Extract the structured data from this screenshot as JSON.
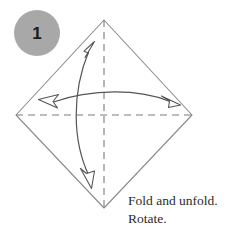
{
  "figure": {
    "kind": "origami-step-diagram",
    "step_badge": {
      "number": "1",
      "shape": "circle",
      "fill_color": "#a8a8a8",
      "text_color": "#1a1a1a",
      "center_x": 37,
      "center_y": 33,
      "radius": 23
    },
    "paper": {
      "name": "square-sheet-rotated-45",
      "outline_color": "#8b8b8b",
      "fill_color": "#ffffff",
      "vertices": [
        {
          "label": "top",
          "x": 104,
          "y": 20
        },
        {
          "label": "right",
          "x": 192,
          "y": 115
        },
        {
          "label": "bottom",
          "x": 104,
          "y": 208
        },
        {
          "label": "left",
          "x": 16,
          "y": 115
        }
      ]
    },
    "crease_lines": [
      {
        "name": "vertical-crease",
        "style": "dashed",
        "color": "#7d7d7d",
        "from": {
          "x": 104,
          "y": 20
        },
        "to": {
          "x": 104,
          "y": 208
        }
      },
      {
        "name": "horizontal-crease",
        "style": "dashed",
        "color": "#7d7d7d",
        "from": {
          "x": 16,
          "y": 115
        },
        "to": {
          "x": 192,
          "y": 115
        }
      }
    ],
    "fold_arrows": [
      {
        "name": "vertical-fold-arrow",
        "orientation": "vertical",
        "double_headed": true,
        "curve_bow": "left",
        "color": "#555555",
        "head_fill": "#ffffff",
        "start": {
          "x": 86,
          "y": 46
        },
        "end": {
          "x": 92,
          "y": 182
        }
      },
      {
        "name": "horizontal-fold-arrow",
        "orientation": "horizontal",
        "double_headed": true,
        "curve_bow": "up",
        "color": "#555555",
        "head_fill": "#ffffff",
        "start": {
          "x": 45,
          "y": 101
        },
        "end": {
          "x": 172,
          "y": 101
        }
      }
    ],
    "caption": {
      "line1": "Fold and unfold.",
      "line2": "Rotate.",
      "color": "#2b2b2b",
      "x": 128,
      "y": 198
    }
  }
}
